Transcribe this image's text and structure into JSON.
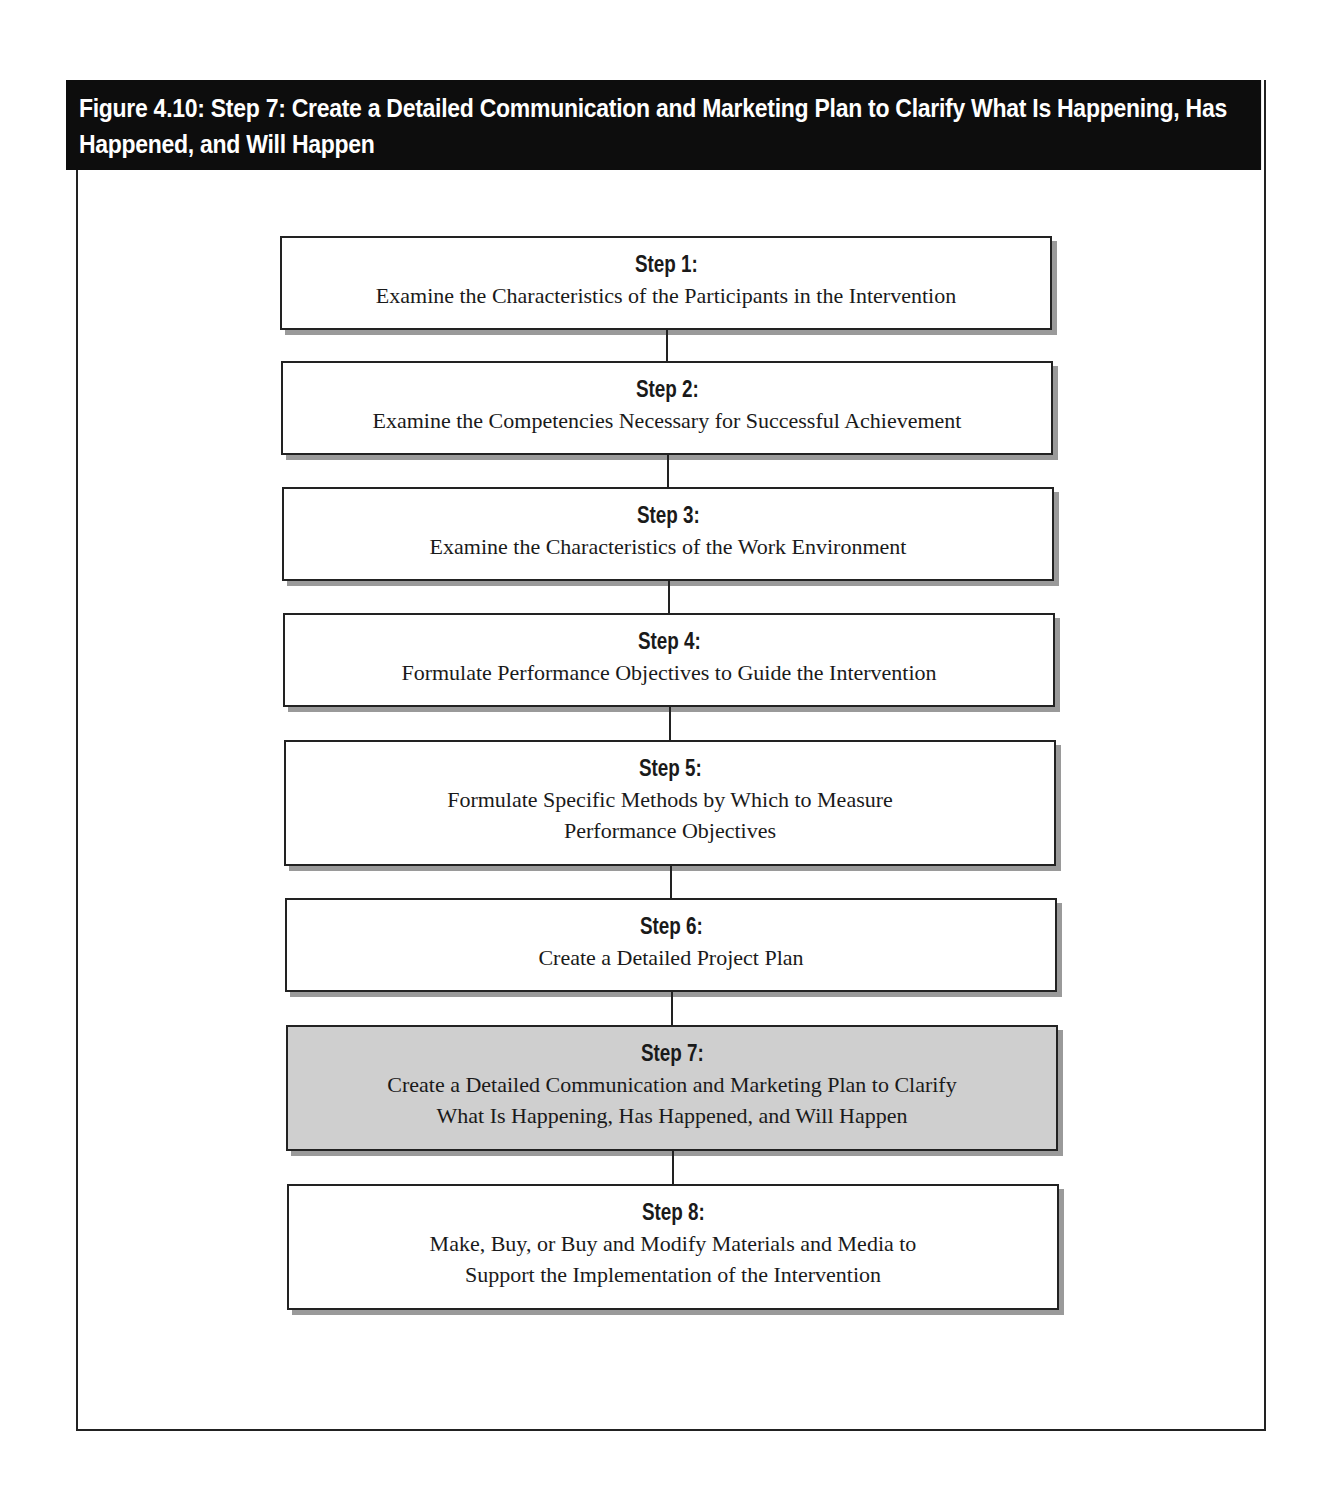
{
  "figure": {
    "title": "Figure 4.10: Step 7: Create a Detailed Communication and Marketing Plan to Clarify What Is Happening, Has Happened, and Will Happen",
    "header_bg": "#0d0d0d",
    "highlight_bg": "#cfcfcf"
  },
  "steps": [
    {
      "label": "Step 1:",
      "lines": [
        "Examine the Characteristics of the Participants in the Intervention"
      ],
      "highlighted": false
    },
    {
      "label": "Step 2:",
      "lines": [
        "Examine the Competencies Necessary for Successful Achievement"
      ],
      "highlighted": false
    },
    {
      "label": "Step 3:",
      "lines": [
        "Examine the Characteristics of the Work Environment"
      ],
      "highlighted": false
    },
    {
      "label": "Step 4:",
      "lines": [
        "Formulate Performance Objectives to Guide the Intervention"
      ],
      "highlighted": false
    },
    {
      "label": "Step 5:",
      "lines": [
        "Formulate Specific Methods by Which to Measure",
        "Performance Objectives"
      ],
      "highlighted": false
    },
    {
      "label": "Step 6:",
      "lines": [
        "Create a Detailed Project Plan"
      ],
      "highlighted": false
    },
    {
      "label": "Step 7:",
      "lines": [
        "Create a Detailed Communication and Marketing Plan to Clarify",
        "What Is Happening, Has Happened, and Will Happen"
      ],
      "highlighted": true
    },
    {
      "label": "Step 8:",
      "lines": [
        "Make, Buy, or Buy and Modify Materials and Media to",
        "Support the Implementation of the Intervention"
      ],
      "highlighted": false
    }
  ]
}
